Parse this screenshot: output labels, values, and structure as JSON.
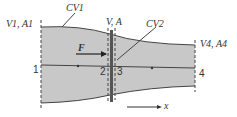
{
  "labels": {
    "cv1": "CV1",
    "cv2": "CV2",
    "inlet": "V1, A1",
    "mid": "V, A",
    "outlet": "V4, A4",
    "force": "F",
    "axis": "x"
  },
  "stations": [
    "1",
    "2",
    "3",
    "4"
  ],
  "colors": {
    "fill": "#c8c8c8",
    "stroke": "#444444"
  }
}
